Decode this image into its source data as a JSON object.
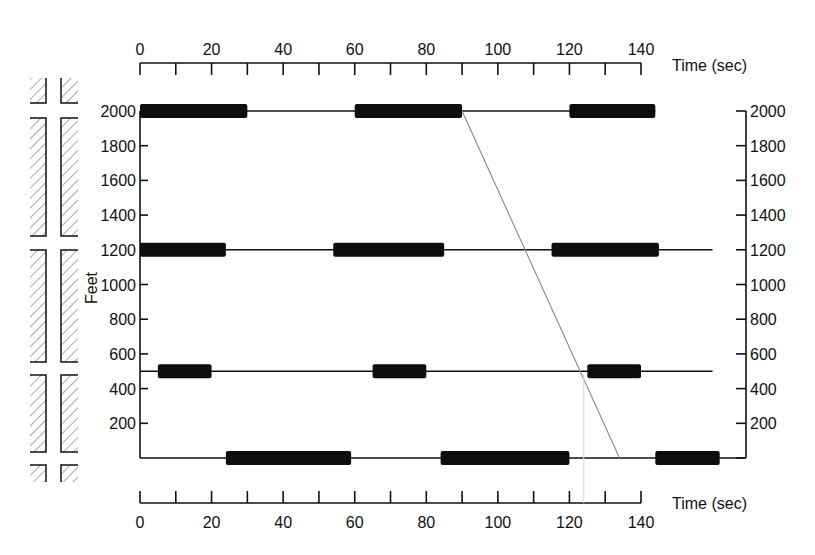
{
  "chart_data": {
    "type": "bar",
    "subtype": "time-space signal progression diagram",
    "title": "",
    "xlabel": "Time (sec)",
    "ylabel": "Feet",
    "xlim": [
      0,
      140
    ],
    "ylim": [
      0,
      2000
    ],
    "x_ticks_labeled": [
      0,
      20,
      40,
      60,
      80,
      100,
      120,
      140
    ],
    "x_ticks_minor_step": 10,
    "y_ticks": [
      200,
      400,
      600,
      800,
      1000,
      1200,
      1400,
      1600,
      1800,
      2000
    ],
    "y_tick_labels": [
      "200",
      "400",
      "600",
      "800",
      "1000",
      "1200",
      "1400",
      "1600",
      "1800",
      "2000"
    ],
    "top_axis": {
      "label": "Time (sec)",
      "tick_labels": [
        "0",
        "20",
        "40",
        "60",
        "80",
        "100",
        "120",
        "140"
      ]
    },
    "bottom_axis": {
      "label": "Time (sec)",
      "tick_labels": [
        "0",
        "20",
        "40",
        "60",
        "80",
        "100",
        "120",
        "140"
      ]
    },
    "left_axis": {
      "label": "Feet",
      "tick_labels": [
        "2000",
        "1800",
        "1600",
        "1400",
        "1200",
        "1000",
        "800",
        "600",
        "400",
        "200"
      ]
    },
    "right_axis": {
      "tick_labels": [
        "2000",
        "1800",
        "1600",
        "1400",
        "1200",
        "1000",
        "800",
        "600",
        "400",
        "200"
      ]
    },
    "series": [
      {
        "name": "Signal at 2000 ft",
        "position_ft": 2000,
        "line_extent_sec": [
          0,
          144
        ],
        "red_intervals_sec": [
          [
            0,
            30
          ],
          [
            60,
            90
          ],
          [
            120,
            144
          ]
        ]
      },
      {
        "name": "Signal at 1200 ft",
        "position_ft": 1200,
        "line_extent_sec": [
          0,
          160
        ],
        "red_intervals_sec": [
          [
            0,
            24
          ],
          [
            54,
            85
          ],
          [
            115,
            145
          ]
        ]
      },
      {
        "name": "Signal at 500 ft",
        "position_ft": 500,
        "line_extent_sec": [
          0,
          160
        ],
        "red_intervals_sec": [
          [
            5,
            20
          ],
          [
            65,
            80
          ],
          [
            125,
            140
          ]
        ]
      },
      {
        "name": "Signal at 0 ft",
        "position_ft": 0,
        "line_extent_sec": [
          0,
          169
        ],
        "red_intervals_sec": [
          [
            24,
            59
          ],
          [
            84,
            120
          ],
          [
            144,
            162
          ]
        ]
      }
    ],
    "annotations": [
      {
        "type": "trajectory-line",
        "from": [
          90,
          2000
        ],
        "to": [
          134,
          0
        ]
      },
      {
        "type": "faint-vertical-line",
        "x_sec": 124
      }
    ],
    "grid": false,
    "legend": "none",
    "side_graphic": "street map with hatched blocks at cross streets (0, 500, 1200, 2000 ft)"
  },
  "colors": {
    "background": "#ffffff",
    "ink": "#111111",
    "bar": "#0d0d0d",
    "trajectory": "#888888",
    "faint_line": "#dddddd"
  }
}
